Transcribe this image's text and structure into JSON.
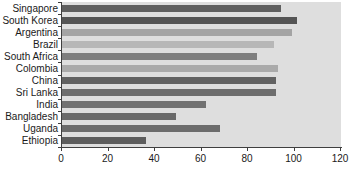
{
  "chart_data": {
    "type": "bar",
    "orientation": "horizontal",
    "title": "",
    "xlabel": "",
    "ylabel": "",
    "categories": [
      "Singapore",
      "South Korea",
      "Argentina",
      "Brazil",
      "South Africa",
      "Colombia",
      "China",
      "Sri Lanka",
      "India",
      "Bangladesh",
      "Uganda",
      "Ethiopia"
    ],
    "values": [
      94,
      101,
      99,
      91,
      84,
      93,
      92,
      92,
      62,
      49,
      68,
      36
    ],
    "bar_colors": [
      "#5f5f5f",
      "#545454",
      "#a4a4a4",
      "#b7b7b7",
      "#7e7e7e",
      "#aaaaaa",
      "#626262",
      "#6d6d6d",
      "#717171",
      "#696969",
      "#6c6c6c",
      "#5d5d5d"
    ],
    "xlim": [
      0,
      120
    ],
    "x_ticks": [
      0,
      20,
      40,
      60,
      80,
      100,
      120
    ],
    "grid": false,
    "legend": false,
    "plot_background": "#dedede",
    "axis_color": "#3f3f3f",
    "label_color": "#1a1a1a"
  }
}
